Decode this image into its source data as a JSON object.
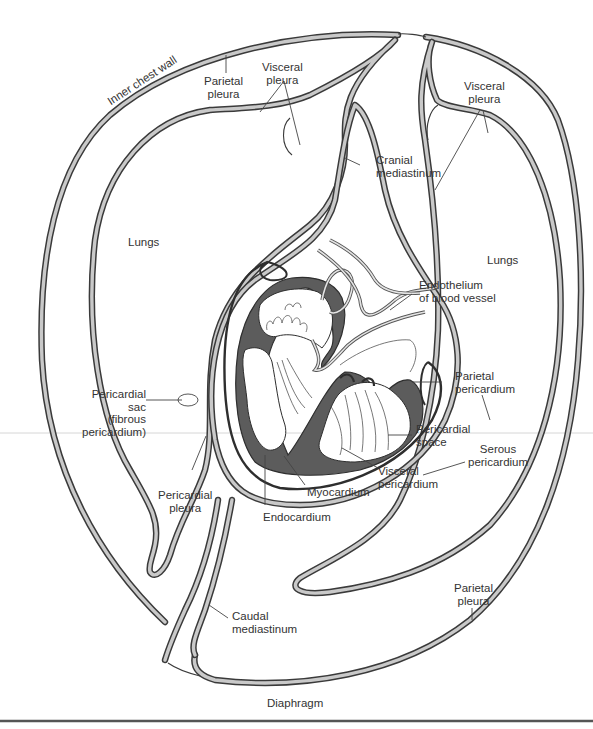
{
  "figure": {
    "type": "anatomical cross-section",
    "colors": {
      "membrane_band_fill": "#c9c9c9",
      "outline": "#3a3a3a",
      "myocardium": "#5c5c5c",
      "background": "#ffffff"
    }
  },
  "labels": {
    "inner_chest_wall": "Inner chest wall",
    "parietal_pleura_top": "Parietal\npleura",
    "visceral_pleura_left": "Visceral\npleura",
    "visceral_pleura_right": "Visceral\npleura",
    "cranial_mediastinum": "Cranial\nmediastinum",
    "lungs_left": "Lungs",
    "lungs_right": "Lungs",
    "endothelium": "Endothelium\nof blood vessel",
    "parietal_pericardium": "Parietal\npericardium",
    "pericardial_sac": "Pericardial\nsac\n(fibrous\npericardium)",
    "pericardial_space": "Pericardial\nspace",
    "serous_pericardium": "Serous\npericardium",
    "visceral_pericardium": "Visceral\npericardium",
    "pericardial_pleura": "Pericardial\npleura",
    "myocardium": "Myocardium",
    "endocardium": "Endocardium",
    "caudal_mediastinum": "Caudal\nmediastinum",
    "parietal_pleura_bottom": "Parietal\npleura",
    "diaphragm": "Diaphragm"
  }
}
